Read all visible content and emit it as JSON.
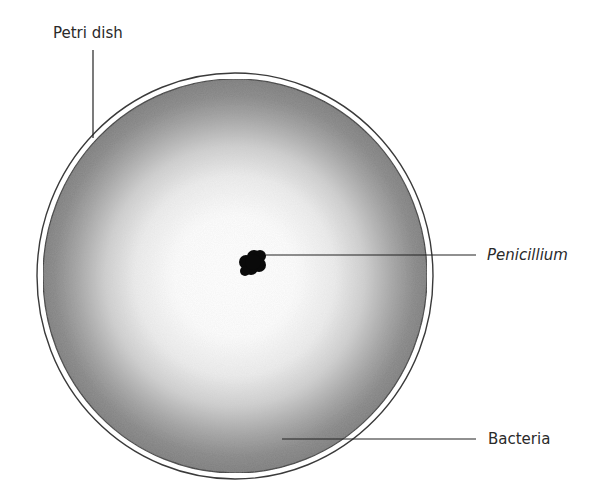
{
  "diagram": {
    "title": "",
    "labels": {
      "petri_dish": "Petri dish",
      "penicillium": "Penicillium",
      "bacteria": "Bacteria"
    },
    "colors": {
      "background": "#ffffff",
      "bacteria_edge": "#7c7c7c",
      "clear_zone": "#ffffff",
      "penicillium": "#0a0a0a",
      "outline": "#3a3a3a",
      "leader_line": "#222222"
    }
  }
}
